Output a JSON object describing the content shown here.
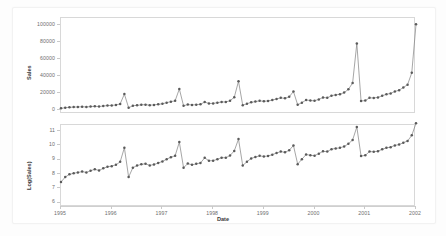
{
  "figure": {
    "background": "#ffffff",
    "line_color": "#808080",
    "marker_color": "#5a5a5a",
    "axis_color": "#d8d8d8"
  },
  "axes": {
    "x_title": "Date",
    "x_ticks": [
      "1995",
      "1996",
      "1997",
      "1998",
      "1999",
      "2000",
      "2001",
      "2002"
    ],
    "sales_title": "Sales",
    "sales_ticks": [
      "0",
      "20000",
      "40000",
      "60000",
      "80000",
      "100000"
    ],
    "log_title": "Log(Sales)",
    "log_ticks": [
      "6",
      "7",
      "8",
      "9",
      "10",
      "11"
    ]
  },
  "chart_data": [
    {
      "type": "line",
      "title": "",
      "xlabel": "Date",
      "ylabel": "Sales",
      "xlim": [
        1995.0,
        2002.0
      ],
      "ylim": [
        -5000,
        108000
      ],
      "grid": false,
      "legend": "none",
      "marker": "circle",
      "x": [
        1995.0,
        1995.0833,
        1995.1667,
        1995.25,
        1995.3333,
        1995.4167,
        1995.5,
        1995.5833,
        1995.6667,
        1995.75,
        1995.8333,
        1995.9167,
        1996.0,
        1996.0833,
        1996.1667,
        1996.25,
        1996.3333,
        1996.4167,
        1996.5,
        1996.5833,
        1996.6667,
        1996.75,
        1996.8333,
        1996.9167,
        1997.0,
        1997.0833,
        1997.1667,
        1997.25,
        1997.3333,
        1997.4167,
        1997.5,
        1997.5833,
        1997.6667,
        1997.75,
        1997.8333,
        1997.9167,
        1998.0,
        1998.0833,
        1998.1667,
        1998.25,
        1998.3333,
        1998.4167,
        1998.5,
        1998.5833,
        1998.6667,
        1998.75,
        1998.8333,
        1998.9167,
        1999.0,
        1999.0833,
        1999.1667,
        1999.25,
        1999.3333,
        1999.4167,
        1999.5,
        1999.5833,
        1999.6667,
        1999.75,
        1999.8333,
        1999.9167,
        2000.0,
        2000.0833,
        2000.1667,
        2000.25,
        2000.3333,
        2000.4167,
        2000.5,
        2000.5833,
        2000.6667,
        2000.75,
        2000.8333,
        2000.9167,
        2001.0,
        2001.0833,
        2001.1667,
        2001.25,
        2001.3333,
        2001.4167,
        2001.5,
        2001.5833,
        2001.6667,
        2001.75,
        2001.8333,
        2001.9167,
        2002.0
      ],
      "values": [
        1700,
        2400,
        2900,
        3100,
        3300,
        3500,
        3300,
        3700,
        4100,
        3800,
        4400,
        4900,
        5100,
        5600,
        6900,
        18500,
        2400,
        4600,
        5300,
        5800,
        6000,
        5400,
        5700,
        6400,
        7100,
        8300,
        9500,
        10500,
        24500,
        4600,
        6100,
        5600,
        6000,
        6400,
        9100,
        7400,
        7500,
        8300,
        9200,
        9100,
        10700,
        14700,
        33500,
        5300,
        7000,
        8800,
        9600,
        10500,
        10000,
        10400,
        11400,
        12700,
        14000,
        13500,
        15300,
        21500,
        5900,
        8300,
        11500,
        10800,
        10600,
        12200,
        14400,
        14000,
        16600,
        17500,
        18200,
        20200,
        24000,
        31500,
        78000,
        10300,
        10800,
        14000,
        13900,
        14500,
        16500,
        18200,
        19200,
        21500,
        23000,
        26200,
        29500,
        43500,
        100500
      ],
      "note": "monthly sales with sharp December seasonal peaks, strong upward trend"
    },
    {
      "type": "line",
      "title": "",
      "xlabel": "Date",
      "ylabel": "Log(Sales)",
      "xlim": [
        1995.0,
        2002.0
      ],
      "ylim": [
        5.7,
        11.4
      ],
      "grid": false,
      "legend": "none",
      "marker": "circle",
      "x": [
        1995.0,
        1995.0833,
        1995.1667,
        1995.25,
        1995.3333,
        1995.4167,
        1995.5,
        1995.5833,
        1995.6667,
        1995.75,
        1995.8333,
        1995.9167,
        1996.0,
        1996.0833,
        1996.1667,
        1996.25,
        1996.3333,
        1996.4167,
        1996.5,
        1996.5833,
        1996.6667,
        1996.75,
        1996.8333,
        1996.9167,
        1997.0,
        1997.0833,
        1997.1667,
        1997.25,
        1997.3333,
        1997.4167,
        1997.5,
        1997.5833,
        1997.6667,
        1997.75,
        1997.8333,
        1997.9167,
        1998.0,
        1998.0833,
        1998.1667,
        1998.25,
        1998.3333,
        1998.4167,
        1998.5,
        1998.5833,
        1998.6667,
        1998.75,
        1998.8333,
        1998.9167,
        1999.0,
        1999.0833,
        1999.1667,
        1999.25,
        1999.3333,
        1999.4167,
        1999.5,
        1999.5833,
        1999.6667,
        1999.75,
        1999.8333,
        1999.9167,
        2000.0,
        2000.0833,
        2000.1667,
        2000.25,
        2000.3333,
        2000.4167,
        2000.5,
        2000.5833,
        2000.6667,
        2000.75,
        2000.8333,
        2000.9167,
        2001.0,
        2001.0833,
        2001.1667,
        2001.25,
        2001.3333,
        2001.4167,
        2001.5,
        2001.5833,
        2001.6667,
        2001.75,
        2001.8333,
        2001.9167,
        2002.0
      ],
      "values": [
        7.44,
        7.78,
        7.97,
        8.04,
        8.1,
        8.16,
        8.1,
        8.22,
        8.32,
        8.24,
        8.39,
        8.5,
        8.54,
        8.63,
        8.84,
        9.82,
        7.78,
        8.43,
        8.58,
        8.67,
        8.7,
        8.59,
        8.65,
        8.76,
        8.87,
        9.02,
        9.16,
        9.26,
        10.21,
        8.43,
        8.72,
        8.63,
        8.7,
        8.76,
        9.12,
        8.91,
        8.92,
        9.02,
        9.13,
        9.12,
        9.28,
        9.6,
        10.42,
        8.58,
        8.85,
        9.08,
        9.17,
        9.26,
        9.21,
        9.25,
        9.34,
        9.45,
        9.55,
        9.51,
        9.64,
        9.98,
        8.68,
        9.02,
        9.35,
        9.29,
        9.27,
        9.41,
        9.57,
        9.55,
        9.72,
        9.77,
        9.81,
        9.91,
        10.09,
        10.36,
        11.26,
        9.24,
        9.29,
        9.55,
        9.54,
        9.58,
        9.71,
        9.81,
        9.86,
        9.98,
        10.04,
        10.17,
        10.29,
        10.68,
        11.52
      ],
      "note": "natural log of sales; seasonal structure stabilised, near-linear trend"
    }
  ]
}
